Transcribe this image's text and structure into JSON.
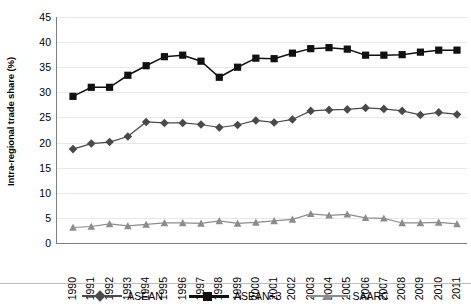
{
  "chart_data": {
    "type": "line",
    "title": "",
    "subtitle": "",
    "xlabel": "",
    "ylabel": "Intra-regional trade share (%)",
    "x": [
      "1990",
      "1991",
      "1992",
      "1993",
      "1994",
      "1995",
      "1996",
      "1997",
      "1998",
      "1999",
      "2000",
      "2001",
      "2002",
      "2003",
      "2004",
      "2005",
      "2006",
      "2007",
      "2008",
      "2009",
      "2010",
      "2011"
    ],
    "categories": [
      "1990",
      "1991",
      "1992",
      "1993",
      "1994",
      "1995",
      "1996",
      "1997",
      "1998",
      "1999",
      "2000",
      "2001",
      "2002",
      "2003",
      "2004",
      "2005",
      "2006",
      "2007",
      "2008",
      "2009",
      "2010",
      "2011"
    ],
    "ylim": [
      0,
      45
    ],
    "yticks": [
      0,
      5,
      10,
      15,
      20,
      25,
      30,
      35,
      40,
      45
    ],
    "grid": true,
    "legend_position": "bottom",
    "series": [
      {
        "name": "ASEAN",
        "marker": "diamond",
        "color": "#4a4a4a",
        "values": [
          18.7,
          19.8,
          20.1,
          21.2,
          24.1,
          23.9,
          23.9,
          23.6,
          23.0,
          23.5,
          24.4,
          24.0,
          24.6,
          26.3,
          26.5,
          26.6,
          26.9,
          26.7,
          26.3,
          25.5,
          26.0,
          25.6
        ]
      },
      {
        "name": "ASEAN+3",
        "marker": "square",
        "color": "#111111",
        "values": [
          29.2,
          31.0,
          31.0,
          33.4,
          35.3,
          37.1,
          37.4,
          36.2,
          33.0,
          35.0,
          36.8,
          36.7,
          37.8,
          38.7,
          38.9,
          38.6,
          37.4,
          37.4,
          37.5,
          38.0,
          38.4,
          38.4
        ]
      },
      {
        "name": "SAARC",
        "marker": "triangle",
        "color": "#8c8c8c",
        "values": [
          3.1,
          3.3,
          3.8,
          3.4,
          3.7,
          4.0,
          4.0,
          3.9,
          4.4,
          3.9,
          4.1,
          4.4,
          4.7,
          5.8,
          5.5,
          5.7,
          5.0,
          4.9,
          4.0,
          4.0,
          4.1,
          3.8
        ]
      }
    ]
  },
  "axes": {
    "y_title": "Intra-regional trade share (%)",
    "y_tick_labels": [
      "45",
      "40",
      "35",
      "30",
      "25",
      "20",
      "15",
      "10",
      "5",
      "0"
    ],
    "x_tick_labels": [
      "1990",
      "1991",
      "1992",
      "1993",
      "1994",
      "1995",
      "1996",
      "1997",
      "1998",
      "1999",
      "2000",
      "2001",
      "2002",
      "2003",
      "2004",
      "2005",
      "2006",
      "2007",
      "2008",
      "2009",
      "2010",
      "2011"
    ]
  },
  "legend": {
    "items": [
      {
        "label": "ASEAN",
        "marker": "diamond-marker",
        "color": "#4a4a4a"
      },
      {
        "label": "ASEAN+3",
        "marker": "square-marker",
        "color": "#111111"
      },
      {
        "label": "SAARC",
        "marker": "triangle-marker",
        "color": "#8c8c8c"
      }
    ]
  }
}
